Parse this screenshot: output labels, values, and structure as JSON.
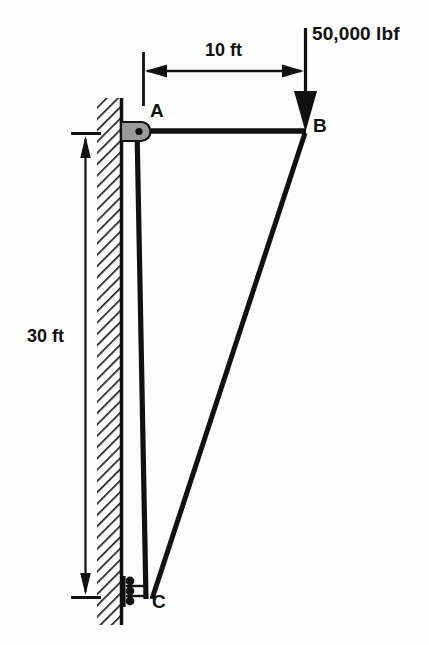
{
  "figure": {
    "kind": "structural-truss-free-body-diagram",
    "wall": {
      "name": "hatched-fixed-wall",
      "hatch_angle_deg": 45,
      "color": "#1a1a1a"
    },
    "members": [
      {
        "id": "AB",
        "from": "A",
        "to": "B",
        "orientation": "horizontal"
      },
      {
        "id": "AC",
        "from": "A",
        "to": "C",
        "orientation": "near-vertical"
      },
      {
        "id": "CB",
        "from": "C",
        "to": "B",
        "orientation": "diagonal"
      }
    ],
    "nodes": [
      {
        "id": "A",
        "label": "A",
        "support": "pin",
        "x": 137,
        "y": 131
      },
      {
        "id": "B",
        "label": "B",
        "support": "none",
        "x": 305,
        "y": 131
      },
      {
        "id": "C",
        "label": "C",
        "support": "roller",
        "x": 145,
        "y": 597
      }
    ],
    "dimensions": [
      {
        "id": "horizontal-span",
        "label": "10 ft",
        "value": 10,
        "unit": "ft",
        "orientation": "horizontal"
      },
      {
        "id": "vertical-height",
        "label": "30 ft",
        "value": 30,
        "unit": "ft",
        "orientation": "vertical"
      }
    ],
    "load": {
      "label": "50,000 lbf",
      "magnitude": 50000,
      "unit": "lbf",
      "direction": "down",
      "applied_at": "B"
    },
    "colors": {
      "line": "#111111",
      "pin_fill": "#9a9a9a",
      "background": "#fdfdfd"
    }
  }
}
